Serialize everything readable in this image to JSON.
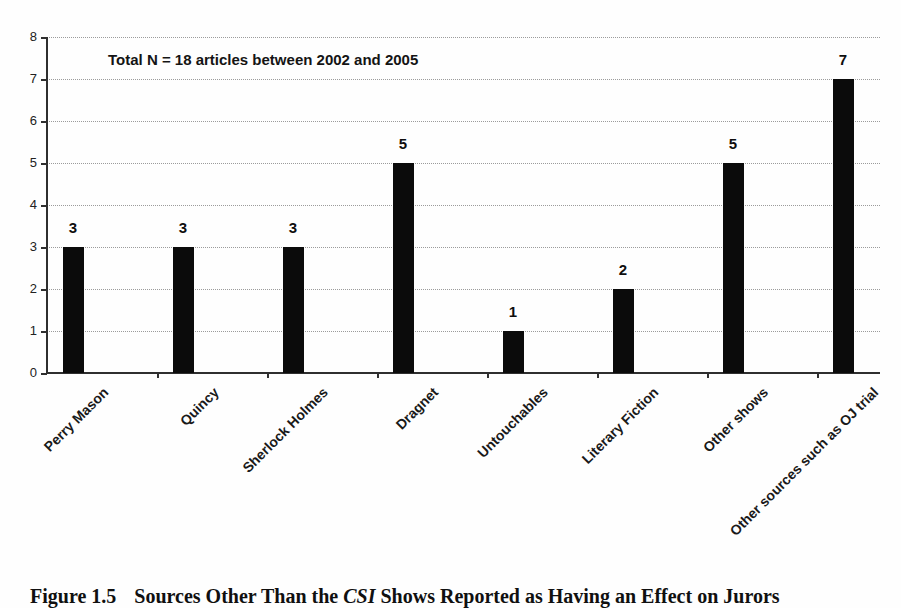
{
  "chart_data": {
    "type": "bar",
    "annotation": "Total N = 18 articles between 2002 and 2005",
    "categories": [
      "Perry Mason",
      "Quincy",
      "Sherlock Holmes",
      "Dragnet",
      "Untouchables",
      "Literary Fiction",
      "Other shows",
      "Other sources such as OJ trial"
    ],
    "values": [
      3,
      3,
      3,
      5,
      1,
      2,
      5,
      7
    ],
    "y_ticks": [
      0,
      1,
      2,
      3,
      4,
      5,
      6,
      7,
      8
    ],
    "ylim": [
      0,
      8
    ],
    "grid": true,
    "gridline_style": "dotted",
    "legend": "none",
    "bar_color": "#0b0b0b",
    "axis_color": "#2f2f2f",
    "gridline_color": "#9b9b9b"
  },
  "caption": {
    "figure_label": "Figure 1.5",
    "text_before_italic": "Sources Other Than the ",
    "italic_text": "CSI",
    "text_after_italic": " Shows Reported as Having an Effect on Jurors"
  }
}
